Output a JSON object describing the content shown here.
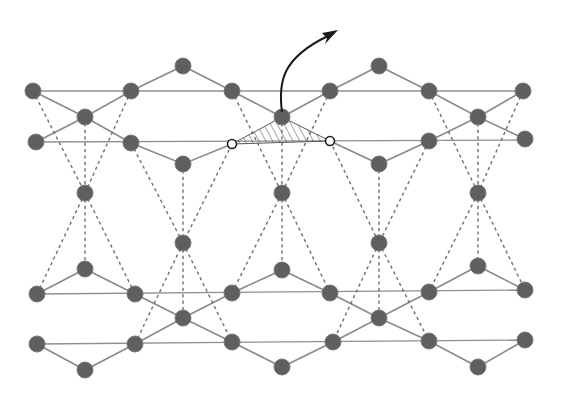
{
  "figure": {
    "colors": {
      "atom": "#5f5f5f",
      "bond": "#8a8a8a",
      "dashed_bond": "#6f6f6f",
      "vacancy_outline": "#1e1e1e",
      "arrow": "#1a1a1a",
      "background": "#ffffff"
    },
    "atoms": [
      [
        33,
        91
      ],
      [
        131,
        91
      ],
      [
        232,
        91
      ],
      [
        330,
        91
      ],
      [
        429,
        91
      ],
      [
        523,
        91
      ],
      [
        183,
        66
      ],
      [
        379,
        66
      ],
      [
        85,
        117
      ],
      [
        282,
        117
      ],
      [
        478,
        117
      ],
      [
        36,
        142
      ],
      [
        131,
        143
      ],
      [
        429,
        141
      ],
      [
        525,
        139
      ],
      [
        183,
        164
      ],
      [
        379,
        164
      ],
      [
        85,
        193
      ],
      [
        282,
        193
      ],
      [
        478,
        193
      ],
      [
        183,
        243
      ],
      [
        379,
        243
      ],
      [
        85,
        269
      ],
      [
        282,
        270
      ],
      [
        478,
        266
      ],
      [
        37,
        294
      ],
      [
        135,
        294
      ],
      [
        232,
        293
      ],
      [
        330,
        293
      ],
      [
        429,
        292
      ],
      [
        525,
        290
      ],
      [
        183,
        318
      ],
      [
        379,
        318
      ],
      [
        37,
        344
      ],
      [
        135,
        344
      ],
      [
        232,
        342
      ],
      [
        333,
        342
      ],
      [
        429,
        341
      ],
      [
        525,
        340
      ],
      [
        85,
        370
      ],
      [
        282,
        367
      ],
      [
        478,
        367
      ]
    ],
    "vacancies": [
      [
        232,
        144
      ],
      [
        330,
        141
      ]
    ],
    "ejected_atom": [
      282,
      117
    ],
    "arrow": {
      "label": "atom-ejection-arrow",
      "from": [
        282,
        117
      ],
      "to": [
        336,
        30
      ]
    },
    "hatched_region": {
      "label": "vacancy-triangle",
      "points": [
        [
          232,
          144
        ],
        [
          282,
          117
        ],
        [
          330,
          141
        ]
      ]
    }
  }
}
